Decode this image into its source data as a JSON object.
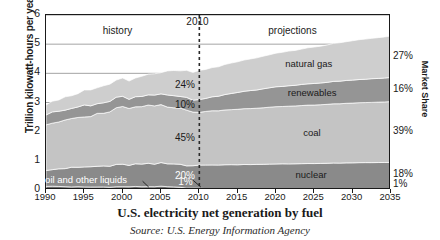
{
  "chart_data": {
    "type": "area",
    "title": "U.S. electricity net generation by fuel",
    "source": "Source: U.S. Energy Information Agency",
    "xlabel": "",
    "ylabel": "Trillion kilowatt-hours per year",
    "right_axis_label": "Market Share",
    "xlim": [
      1990,
      2035
    ],
    "ylim": [
      0,
      6
    ],
    "yticks": [
      0,
      1,
      2,
      3,
      4,
      5,
      6
    ],
    "xticks": [
      1990,
      1995,
      2000,
      2005,
      2010,
      2015,
      2020,
      2025,
      2030,
      2035
    ],
    "grid": true,
    "stacked": true,
    "legend_position": "inline-annotations",
    "divider_year": 2010,
    "divider_label": "2010",
    "era_labels": [
      {
        "text": "history",
        "year": 2000
      },
      {
        "text": "projections",
        "year": 2023
      }
    ],
    "annotations": [
      {
        "text": "oil and other liquids",
        "series": "oil and other liquids",
        "year": 1997
      },
      {
        "text": "natural gas",
        "series": "natural gas",
        "year": 2025
      },
      {
        "text": "renewables",
        "series": "renewables",
        "year": 2025
      },
      {
        "text": "coal",
        "series": "coal",
        "year": 2025
      },
      {
        "text": "nuclear",
        "series": "nuclear",
        "year": 2025
      }
    ],
    "share_labels_2010": [
      {
        "series": "natural gas",
        "value": "24%"
      },
      {
        "series": "renewables",
        "value": "10%"
      },
      {
        "series": "coal",
        "value": "45%"
      },
      {
        "series": "nuclear",
        "value": "20%"
      },
      {
        "series": "oil and other liquids",
        "value": "1%"
      }
    ],
    "share_labels_2035": [
      {
        "series": "natural gas",
        "value": "27%"
      },
      {
        "series": "renewables",
        "value": "16%"
      },
      {
        "series": "coal",
        "value": "39%"
      },
      {
        "series": "nuclear",
        "value": "18%"
      },
      {
        "series": "oil and other liquids",
        "value": "1%"
      }
    ],
    "x": [
      1990,
      1995,
      2000,
      2005,
      2010,
      2015,
      2020,
      2025,
      2030,
      2035
    ],
    "series": [
      {
        "name": "oil and other liquids",
        "color": "#6e6e6e",
        "values": [
          0.13,
          0.1,
          0.11,
          0.12,
          0.05,
          0.05,
          0.05,
          0.05,
          0.05,
          0.05
        ]
      },
      {
        "name": "nuclear",
        "color": "#8a8a8a",
        "values": [
          0.58,
          0.68,
          0.75,
          0.78,
          0.8,
          0.82,
          0.84,
          0.86,
          0.88,
          0.9
        ]
      },
      {
        "name": "coal",
        "color": "#c4c4c4",
        "values": [
          1.58,
          1.7,
          1.97,
          2.01,
          1.83,
          1.9,
          1.96,
          2.01,
          2.05,
          2.08
        ]
      },
      {
        "name": "renewables",
        "color": "#959595",
        "values": [
          0.36,
          0.38,
          0.34,
          0.38,
          0.42,
          0.58,
          0.68,
          0.74,
          0.79,
          0.83
        ]
      },
      {
        "name": "natural gas",
        "color": "#cecece",
        "values": [
          0.37,
          0.5,
          0.6,
          0.76,
          0.98,
          1.05,
          1.15,
          1.25,
          1.35,
          1.42
        ]
      }
    ]
  }
}
